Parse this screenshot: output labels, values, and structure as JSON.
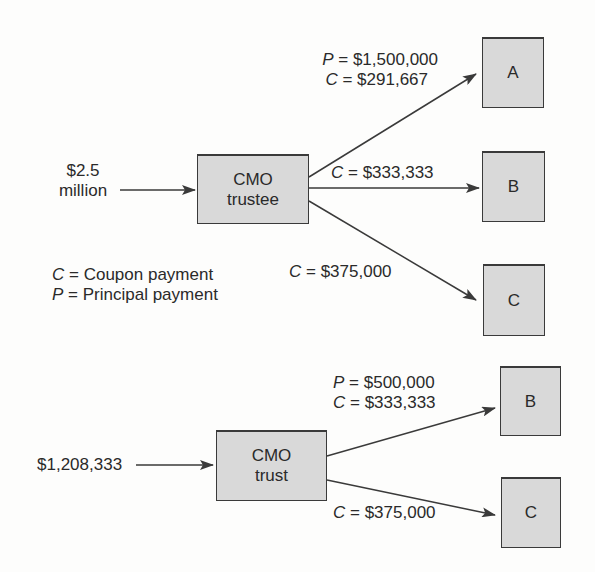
{
  "diagram_top": {
    "input": {
      "line1": "$2.5",
      "line2": "million"
    },
    "trustee": {
      "line1": "CMO",
      "line2": "trustee"
    },
    "tranches": [
      {
        "name": "A",
        "flow": {
          "p_sym": "P",
          "p_val": "= $1,500,000",
          "c_sym": "C",
          "c_val": "= $291,667"
        }
      },
      {
        "name": "B",
        "flow": {
          "c_sym": "C",
          "c_val": "= $333,333"
        }
      },
      {
        "name": "C",
        "flow": {
          "c_sym": "C",
          "c_val": "= $375,000"
        }
      }
    ]
  },
  "legend": {
    "items": [
      {
        "sym": "C",
        "text": "= Coupon payment"
      },
      {
        "sym": "P",
        "text": "= Principal payment"
      }
    ]
  },
  "diagram_bottom": {
    "input": {
      "value": "$1,208,333"
    },
    "trust": {
      "line1": "CMO",
      "line2": "trust"
    },
    "tranches": [
      {
        "name": "B",
        "flow": {
          "p_sym": "P",
          "p_val": "= $500,000",
          "c_sym": "C",
          "c_val": "= $333,333"
        }
      },
      {
        "name": "C",
        "flow": {
          "c_sym": "C",
          "c_val": "= $375,000"
        }
      }
    ]
  },
  "colors": {
    "box_fill": "#d9d9d9",
    "stroke": "#3a3a3a",
    "text": "#2a2a2a"
  }
}
